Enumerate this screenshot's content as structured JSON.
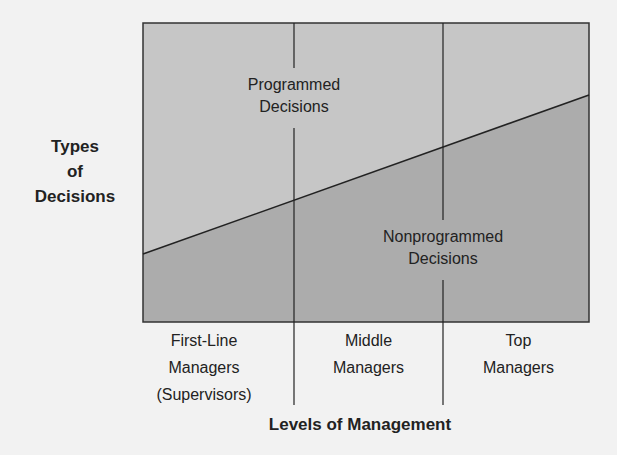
{
  "diagram": {
    "y_axis_label": [
      "Types",
      "of",
      "Decisions"
    ],
    "x_axis_label": "Levels of Management",
    "regions": {
      "upper": {
        "label": [
          "Programmed",
          "Decisions"
        ],
        "color": "#c4c4c4"
      },
      "lower": {
        "label": [
          "Nonprogrammed",
          "Decisions"
        ],
        "color": "#a9a9a9"
      }
    },
    "columns": [
      {
        "label": [
          "First-Line",
          "Managers",
          "(Supervisors)"
        ]
      },
      {
        "label": [
          "Middle",
          "Managers"
        ]
      },
      {
        "label": [
          "Top",
          "Managers"
        ]
      }
    ],
    "divider_line": {
      "from": [
        143,
        254
      ],
      "to": [
        589,
        95
      ]
    },
    "colors": {
      "background": "#f2f2f2",
      "line": "#222222"
    }
  }
}
